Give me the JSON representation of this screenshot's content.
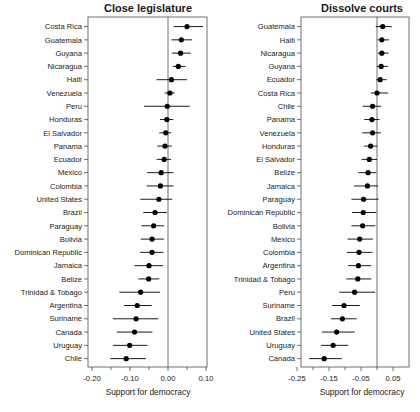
{
  "figure": {
    "width": 420,
    "height": 412,
    "background": "#ffffff",
    "foreground": "#1a1a1a"
  },
  "chart_data": [
    {
      "type": "scatter",
      "subtype": "forest-plot",
      "panel_id": "close-legislature",
      "title": "Close legislature",
      "xlabel": "Support for democracy",
      "ylabel": "",
      "grid": false,
      "legend": "none",
      "xlim": [
        -0.235,
        -0.235
      ],
      "xticks": [
        -0.2,
        -0.1,
        0.0,
        0.1
      ],
      "xticklabels": [
        "-0.20",
        "-0.10",
        "0.00",
        "0.10"
      ],
      "minor_xticks": [
        -0.15,
        -0.05,
        0.05
      ],
      "zero_reference": 0.0,
      "categories": [
        "Costa Rica",
        "Guatemala",
        "Guyana",
        "Nicaragua",
        "Haiti",
        "Venezuela",
        "Peru",
        "Honduras",
        "El Salvador",
        "Panama",
        "Ecuador",
        "Mexico",
        "Colombia",
        "United States",
        "Brazil",
        "Paraguay",
        "Bolivia",
        "Dominican Republic",
        "Jamaica",
        "Belize",
        "Trinidad & Tobago",
        "Argentina",
        "Suriname",
        "Canada",
        "Uruguay",
        "Chile"
      ],
      "values": [
        0.05,
        0.035,
        0.033,
        0.027,
        0.009,
        0.005,
        -0.002,
        -0.003,
        -0.006,
        -0.008,
        -0.01,
        -0.018,
        -0.02,
        -0.024,
        -0.034,
        -0.038,
        -0.042,
        -0.042,
        -0.05,
        -0.051,
        -0.072,
        -0.081,
        -0.084,
        -0.088,
        -0.101,
        -0.11
      ],
      "ci_low": [
        0.015,
        0.009,
        0.01,
        0.012,
        -0.03,
        -0.009,
        -0.063,
        -0.021,
        -0.023,
        -0.028,
        -0.03,
        -0.055,
        -0.056,
        -0.073,
        -0.065,
        -0.07,
        -0.072,
        -0.073,
        -0.088,
        -0.078,
        -0.128,
        -0.116,
        -0.145,
        -0.135,
        -0.145,
        -0.152
      ],
      "ci_high": [
        0.092,
        0.063,
        0.06,
        0.046,
        0.05,
        0.018,
        0.057,
        0.014,
        0.008,
        0.01,
        0.008,
        0.014,
        0.014,
        0.011,
        -0.003,
        -0.01,
        -0.011,
        -0.012,
        -0.013,
        -0.023,
        -0.021,
        -0.043,
        -0.026,
        -0.041,
        -0.054,
        -0.058
      ]
    },
    {
      "type": "scatter",
      "subtype": "forest-plot",
      "panel_id": "dissolve-courts",
      "title": "Dissolve courts",
      "xlabel": "Support for democracy",
      "ylabel": "",
      "grid": false,
      "legend": "none",
      "xlim": [
        -0.3,
        0.08
      ],
      "xticks": [
        -0.25,
        -0.15,
        -0.05,
        0.05
      ],
      "xticklabels": [
        "-0.25",
        "-0.15",
        "-0.05",
        "0.05"
      ],
      "minor_xticks": [
        -0.2,
        -0.1,
        0.0
      ],
      "zero_reference": 0.0,
      "categories": [
        "Guatemala",
        "Haiti",
        "Nicaragua",
        "Guyana",
        "Ecuador",
        "Costa Rica",
        "Chile",
        "Panama",
        "Venezuela",
        "Honduras",
        "El Salvador",
        "Belize",
        "Jamaica",
        "Paraguay",
        "Dominican Republic",
        "Bolivia",
        "Mexico",
        "Colombia",
        "Argentina",
        "Trinidad & Tobago",
        "Peru",
        "Suriname",
        "Brazil",
        "United States",
        "Uruguay",
        "Canada"
      ],
      "values": [
        0.018,
        0.015,
        0.015,
        0.013,
        0.01,
        0.0,
        -0.014,
        -0.016,
        -0.014,
        -0.02,
        -0.024,
        -0.028,
        -0.03,
        -0.042,
        -0.043,
        -0.045,
        -0.054,
        -0.056,
        -0.058,
        -0.06,
        -0.07,
        -0.103,
        -0.108,
        -0.126,
        -0.137,
        -0.165
      ],
      "ci_low": [
        -0.004,
        0.002,
        0.003,
        0.0,
        -0.002,
        -0.02,
        -0.045,
        -0.04,
        -0.046,
        -0.04,
        -0.048,
        -0.058,
        -0.072,
        -0.08,
        -0.078,
        -0.08,
        -0.092,
        -0.094,
        -0.09,
        -0.096,
        -0.118,
        -0.14,
        -0.144,
        -0.172,
        -0.175,
        -0.212
      ],
      "ci_high": [
        0.046,
        0.038,
        0.036,
        0.034,
        0.03,
        0.035,
        0.013,
        0.008,
        0.012,
        0.001,
        0.0,
        -0.002,
        0.003,
        0.005,
        -0.002,
        -0.005,
        -0.013,
        -0.014,
        -0.018,
        -0.018,
        -0.006,
        -0.054,
        -0.064,
        -0.07,
        -0.09,
        -0.11
      ]
    }
  ]
}
